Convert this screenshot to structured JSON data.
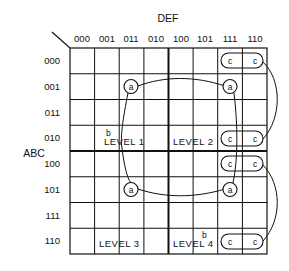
{
  "diagram": {
    "type": "karnaugh-map",
    "column_variable": "DEF",
    "row_variable": "ABC",
    "columns": [
      "000",
      "001",
      "011",
      "010",
      "100",
      "101",
      "111",
      "110"
    ],
    "rows": [
      "000",
      "001",
      "011",
      "010",
      "100",
      "101",
      "111",
      "110"
    ],
    "levels": [
      {
        "label": "LEVEL 1",
        "marker": "b"
      },
      {
        "label": "LEVEL 2"
      },
      {
        "label": "LEVEL 3"
      },
      {
        "label": "LEVEL 4",
        "marker": "b"
      }
    ],
    "a_marker": "a",
    "c_marker": "c",
    "colors": {
      "line": "#111111",
      "background": "#ffffff"
    }
  }
}
